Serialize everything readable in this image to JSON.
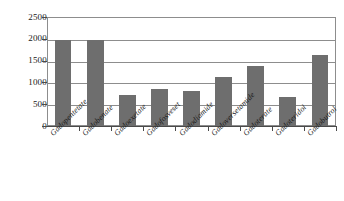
{
  "chart_data": {
    "type": "bar",
    "title": "",
    "subtitle": "",
    "xlabel": "",
    "ylabel": "",
    "ylim": [
      0,
      2500
    ],
    "yticks": [
      0,
      500,
      1000,
      1500,
      2000,
      2500
    ],
    "ytick_labels": [
      "0",
      "500",
      "1000",
      "1500",
      "2000",
      "2500"
    ],
    "grid": true,
    "legend": false,
    "legend_position": "none",
    "bar_color": "#6e6e6e",
    "axis_color": "#4a4a4a",
    "grid_color": "#8d8d8d",
    "background_color": "#ffffff",
    "categories": [
      "Gadopentetate",
      "Gadobenate",
      "Gadoexetate",
      "Gadofosveset",
      "Gadodiamide",
      "Gadoversetamide",
      "Gadoterate",
      "Gadoteridol",
      "Gadobutrol"
    ],
    "values": [
      1970,
      1970,
      700,
      840,
      800,
      1130,
      1380,
      660,
      1640
    ]
  }
}
